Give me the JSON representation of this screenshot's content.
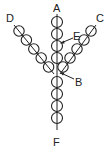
{
  "diagram": {
    "title": "",
    "labels": {
      "A": "A",
      "B": "B",
      "C": "C",
      "D": "D",
      "E": "E",
      "F": "F"
    },
    "strands": [
      {
        "name": "center-top-strand",
        "end_label": "A",
        "bead_count": 4
      },
      {
        "name": "left-strand",
        "end_label": "D",
        "bead_count": 5
      },
      {
        "name": "right-strand",
        "end_label": "C",
        "bead_count": 5
      },
      {
        "name": "center-bottom-strand",
        "end_label": "F",
        "bead_count": 4
      }
    ],
    "pointers": [
      {
        "label": "E",
        "target": "center strand thread"
      },
      {
        "label": "B",
        "target": "junction bead"
      }
    ]
  }
}
